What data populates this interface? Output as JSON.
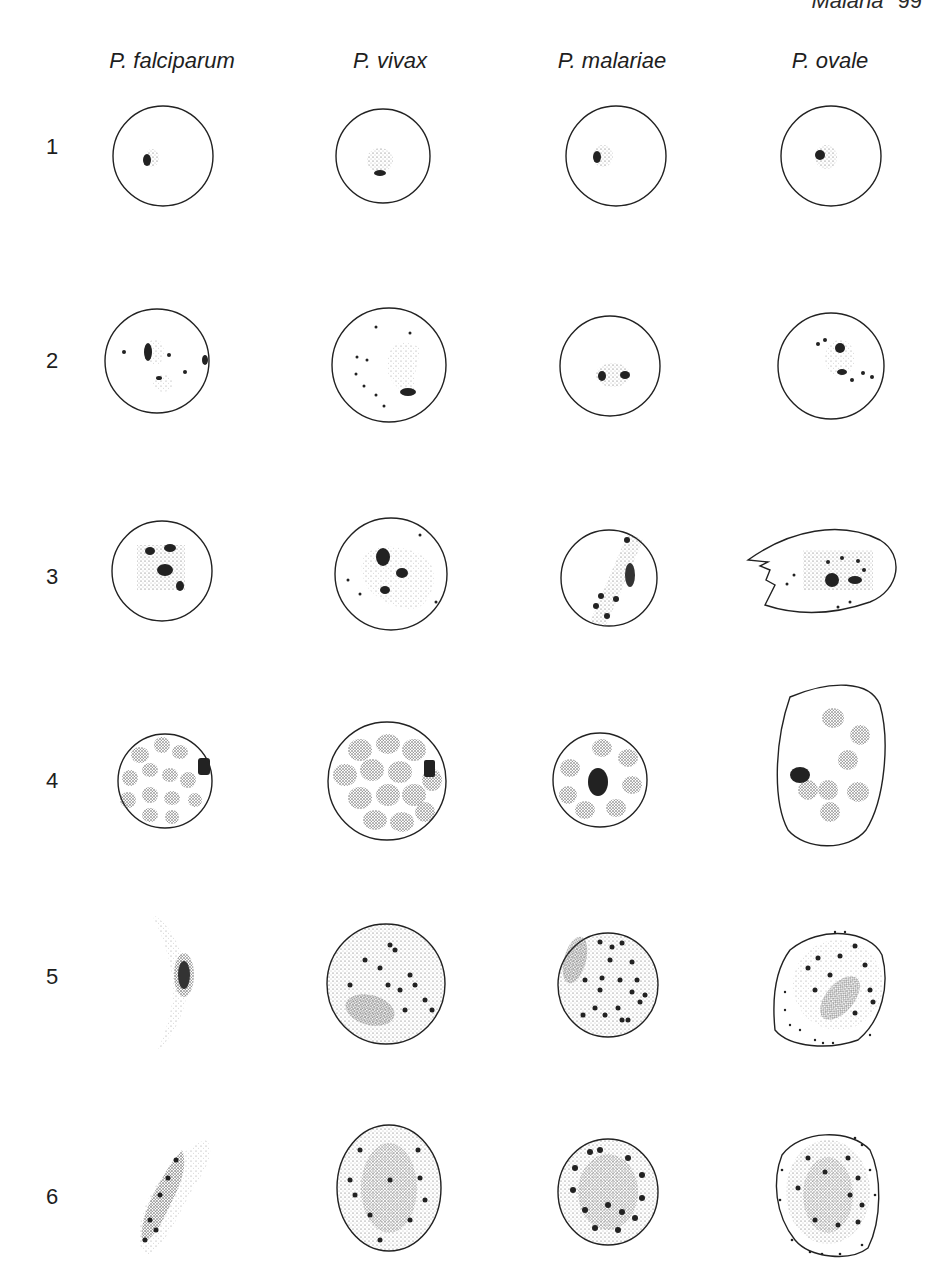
{
  "page": {
    "running_head": "Malaria",
    "page_number": "99"
  },
  "columns": [
    {
      "label": "P. falciparum",
      "x": 172
    },
    {
      "label": "P. vivax",
      "x": 390
    },
    {
      "label": "P. malariae",
      "x": 612
    },
    {
      "label": "P. ovale",
      "x": 830
    }
  ],
  "rows": [
    {
      "label": "1",
      "y": 146
    },
    {
      "label": "2",
      "y": 360
    },
    {
      "label": "3",
      "y": 576
    },
    {
      "label": "4",
      "y": 780
    },
    {
      "label": "5",
      "y": 976
    },
    {
      "label": "6",
      "y": 1196
    }
  ]
}
